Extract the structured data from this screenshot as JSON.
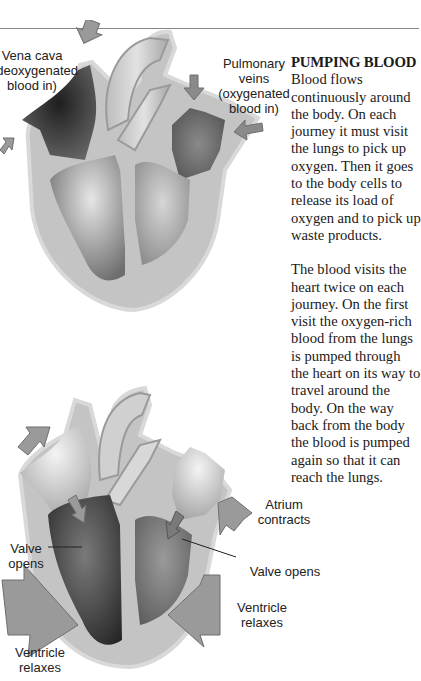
{
  "article": {
    "heading": "PUMPING BLOOD",
    "paragraphs": [
      "Blood flows continuously around the body. On each journey it must visit the lungs to pick up oxygen. Then it goes to the body cells to release its load of oxygen and to pick up waste products.",
      "The blood visits the heart twice on each journey. On the first visit the oxygen-rich blood from the lungs is pumped through the heart on its way to travel around the body. On the way back from the body the blood is pumped again so that it can reach the lungs."
    ]
  },
  "diagram_top": {
    "labels": {
      "vena_cava": [
        "Vena cava",
        "(deoxygenated",
        "blood in)"
      ],
      "pulmonary_veins": [
        "Pulmonary",
        "veins",
        "(oxygenated",
        "blood in)"
      ]
    }
  },
  "diagram_bottom": {
    "labels": {
      "valve_opens_left": [
        "Valve",
        "opens"
      ],
      "atrium_contracts": [
        "Atrium",
        "contracts"
      ],
      "valve_opens_right": [
        "Valve opens"
      ],
      "ventricle_relaxes_right": [
        "Ventricle",
        "relaxes"
      ],
      "ventricle_relaxes_left": [
        "Ventricle",
        "relaxes"
      ]
    }
  },
  "colors": {
    "heart_wall": "#c4c4c4",
    "heart_outline": "#d9d9d9",
    "arrow_fill": "#9a9a9a",
    "arrow_stroke": "#6e6e6e",
    "dark_chamber": "#2e2e2e",
    "rule": "#888888"
  }
}
